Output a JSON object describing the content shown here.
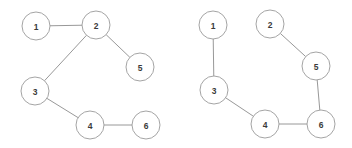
{
  "page": {
    "background_color": "#ffffff",
    "width": 352,
    "height": 148
  },
  "style": {
    "node_fill": "#ffffff",
    "node_stroke": "#9a9a9a",
    "edge_stroke": "#8c8c8c",
    "label_color": "#3a3a3a",
    "node_radius": 14,
    "stroke_width": 0.9
  },
  "graphs": [
    {
      "id": "graph-left",
      "name": "left-graph",
      "nodes": [
        {
          "id": "L1",
          "label": "1",
          "cx": 36,
          "cy": 26,
          "r": 14
        },
        {
          "id": "L2",
          "label": "2",
          "cx": 96,
          "cy": 25,
          "r": 14
        },
        {
          "id": "L3",
          "label": "3",
          "cx": 35,
          "cy": 91,
          "r": 14
        },
        {
          "id": "L4",
          "label": "4",
          "cx": 90,
          "cy": 125,
          "r": 14
        },
        {
          "id": "L5",
          "label": "5",
          "cx": 140,
          "cy": 67,
          "r": 14
        },
        {
          "id": "L6",
          "label": "6",
          "cx": 146,
          "cy": 125,
          "r": 14
        }
      ],
      "edges": [
        {
          "id": "L1-L2",
          "from": "L1",
          "to": "L2"
        },
        {
          "id": "L2-L3",
          "from": "L2",
          "to": "L3"
        },
        {
          "id": "L2-L5",
          "from": "L2",
          "to": "L5"
        },
        {
          "id": "L3-L4",
          "from": "L3",
          "to": "L4"
        },
        {
          "id": "L4-L6",
          "from": "L4",
          "to": "L6"
        }
      ]
    },
    {
      "id": "graph-right",
      "name": "right-graph",
      "nodes": [
        {
          "id": "R1",
          "label": "1",
          "cx": 213,
          "cy": 25,
          "r": 14
        },
        {
          "id": "R2",
          "label": "2",
          "cx": 270,
          "cy": 24,
          "r": 14
        },
        {
          "id": "R3",
          "label": "3",
          "cx": 214,
          "cy": 90,
          "r": 14
        },
        {
          "id": "R4",
          "label": "4",
          "cx": 265,
          "cy": 124,
          "r": 14
        },
        {
          "id": "R5",
          "label": "5",
          "cx": 316,
          "cy": 66,
          "r": 14
        },
        {
          "id": "R6",
          "label": "6",
          "cx": 321,
          "cy": 124,
          "r": 14
        }
      ],
      "edges": [
        {
          "id": "R1-R3",
          "from": "R1",
          "to": "R3"
        },
        {
          "id": "R2-R5",
          "from": "R2",
          "to": "R5"
        },
        {
          "id": "R5-R6",
          "from": "R5",
          "to": "R6"
        },
        {
          "id": "R3-R4",
          "from": "R3",
          "to": "R4"
        },
        {
          "id": "R4-R6",
          "from": "R4",
          "to": "R6"
        }
      ]
    }
  ],
  "chart_data": {
    "type": "diagram",
    "subtype": "node-link-graph-pair",
    "graphs": [
      {
        "name": "left-graph",
        "node_labels": [
          "1",
          "2",
          "3",
          "4",
          "5",
          "6"
        ],
        "edges": [
          [
            "1",
            "2"
          ],
          [
            "2",
            "3"
          ],
          [
            "2",
            "5"
          ],
          [
            "3",
            "4"
          ],
          [
            "4",
            "6"
          ]
        ],
        "edge_count": 5,
        "node_count": 6,
        "degrees": {
          "1": 1,
          "2": 3,
          "3": 2,
          "4": 2,
          "5": 1,
          "6": 1
        }
      },
      {
        "name": "right-graph",
        "node_labels": [
          "1",
          "2",
          "3",
          "4",
          "5",
          "6"
        ],
        "edges": [
          [
            "1",
            "3"
          ],
          [
            "2",
            "5"
          ],
          [
            "3",
            "4"
          ],
          [
            "4",
            "6"
          ],
          [
            "5",
            "6"
          ]
        ],
        "edge_count": 5,
        "node_count": 6,
        "degrees": {
          "1": 1,
          "2": 1,
          "3": 2,
          "4": 2,
          "5": 2,
          "6": 2
        }
      }
    ]
  }
}
